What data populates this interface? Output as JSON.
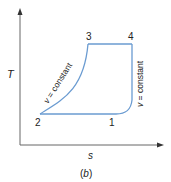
{
  "diagram": {
    "type": "T-s diagram",
    "caption": "(b)",
    "axes": {
      "y_label": "T",
      "x_label": "s"
    },
    "points": [
      {
        "id": "1",
        "label": "1"
      },
      {
        "id": "2",
        "label": "2"
      },
      {
        "id": "3",
        "label": "3"
      },
      {
        "id": "4",
        "label": "4"
      }
    ],
    "processes": [
      {
        "from": "2",
        "to": "3",
        "label": "v = constant",
        "label_var": "v",
        "label_rest": " = constant"
      },
      {
        "from": "3",
        "to": "4",
        "label": ""
      },
      {
        "from": "4",
        "to": "1",
        "label": "v = constant",
        "label_var": "v",
        "label_rest": " = constant"
      },
      {
        "from": "1",
        "to": "2",
        "label": ""
      }
    ],
    "colors": {
      "cycle": "#6a9bd1",
      "axis": "#555555",
      "text": "#222222"
    }
  }
}
